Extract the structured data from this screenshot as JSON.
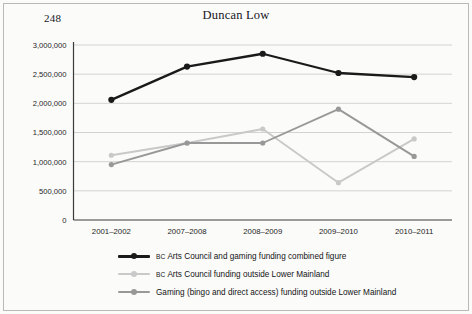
{
  "page": {
    "folio": "248",
    "background_color": "#fbfbfa",
    "border_color": "#b9b9b5"
  },
  "header": {
    "title": "Duncan Low"
  },
  "chart_data": {
    "type": "line",
    "title": "Duncan Low",
    "xlabel": "",
    "ylabel": "",
    "ylim": [
      0,
      3000000
    ],
    "grid": true,
    "legend_position": "bottom",
    "categories": [
      "2001–2002",
      "2007–2008",
      "2008–2009",
      "2009–2010",
      "2010–2011"
    ],
    "ytick_labels": [
      "0",
      "500,000",
      "1,000,000",
      "1,500,000",
      "2,000,000",
      "2,500,000",
      "3,000,000"
    ],
    "ytick_values": [
      0,
      500000,
      1000000,
      1500000,
      2000000,
      2500000,
      3000000
    ],
    "series": [
      {
        "name": "BC Arts Council and gaming funding combined figure",
        "legend_prefix": "BC",
        "legend_rest": " Arts Council and gaming funding combined figure",
        "color": "#1a1a1a",
        "values": [
          2060000,
          2630000,
          2850000,
          2520000,
          2450000
        ]
      },
      {
        "name": "BC Arts Council funding outside Lower Mainland",
        "legend_prefix": "BC",
        "legend_rest": " Arts Council funding outside Lower Mainland",
        "color": "#c9c9c9",
        "values": [
          1110000,
          1320000,
          1560000,
          640000,
          1390000
        ]
      },
      {
        "name": "Gaming (bingo and direct access) funding outside Lower Mainland",
        "legend_prefix": "",
        "legend_rest": "Gaming (bingo and direct access) funding outside Lower Mainland",
        "color": "#989898",
        "values": [
          950000,
          1320000,
          1320000,
          1900000,
          1090000
        ]
      }
    ]
  }
}
